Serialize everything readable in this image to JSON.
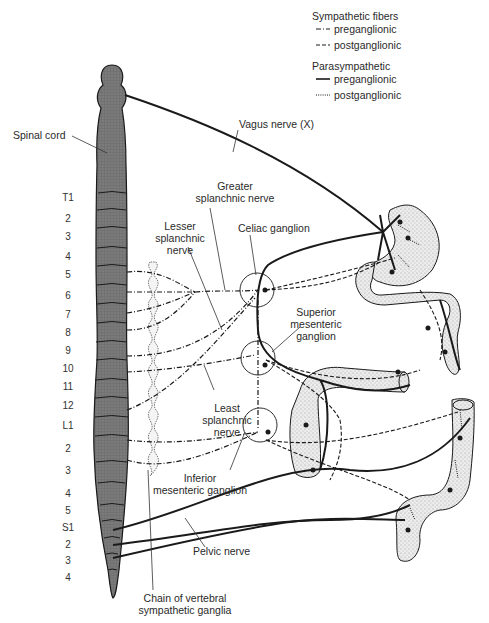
{
  "legend": {
    "sympathetic": {
      "title": "Sympathetic fibers",
      "items": [
        {
          "label": "preganglionic",
          "style": "dash-dot"
        },
        {
          "label": "postganglionic",
          "style": "dashed"
        }
      ]
    },
    "parasympathetic": {
      "title": "Parasympathetic",
      "items": [
        {
          "label": "preganglionic",
          "style": "solid"
        },
        {
          "label": "postganglionic",
          "style": "dotted"
        }
      ]
    }
  },
  "labels": {
    "spinal_cord": "Spinal cord",
    "vagus": "Vagus nerve (X)",
    "greater_splanchnic": [
      "Greater",
      "splanchnic nerve"
    ],
    "lesser_splanchnic": [
      "Lesser",
      "splanchnic",
      "nerve"
    ],
    "celiac": "Celiac ganglion",
    "superior_mesenteric": [
      "Superior",
      "mesenteric",
      "ganglion"
    ],
    "least_splanchnic": [
      "Least",
      "splanchnic",
      "nerve"
    ],
    "inferior_mesenteric": [
      "Inferior",
      "mesenteric ganglion"
    ],
    "pelvic": "Pelvic nerve",
    "chain": [
      "Chain of vertebral",
      "sympathetic ganglia"
    ]
  },
  "segments": [
    "T1",
    "2",
    "3",
    "4",
    "5",
    "6",
    "7",
    "8",
    "9",
    "10",
    "11",
    "12",
    "L1",
    "2",
    "3",
    "4",
    "5",
    "S1",
    "2",
    "3",
    "4"
  ],
  "colors": {
    "ink": "#1a1a1a",
    "cord": "#6e6e6e",
    "organ": "#e2e2e2"
  }
}
